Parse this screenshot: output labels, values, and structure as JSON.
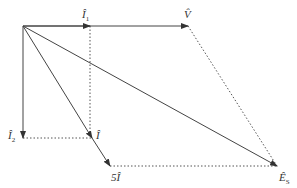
{
  "diagram": {
    "type": "phasor-diagram",
    "colors": {
      "line": "#444444",
      "dotted": "#555555",
      "text": "#333333",
      "background": "#ffffff"
    },
    "origin": {
      "x": 23,
      "y": 26
    },
    "vectors": [
      {
        "id": "I1",
        "label": "Î",
        "sub": "1",
        "from": [
          23,
          26
        ],
        "to": [
          90,
          26
        ],
        "style": "solid"
      },
      {
        "id": "V",
        "label": "V̂",
        "sub": "",
        "from": [
          23,
          26
        ],
        "to": [
          188,
          26
        ],
        "style": "solid"
      },
      {
        "id": "I2",
        "label": "Î",
        "sub": "2",
        "from": [
          23,
          26
        ],
        "to": [
          23,
          138
        ],
        "style": "solid"
      },
      {
        "id": "I",
        "label": "Î",
        "sub": "",
        "from": [
          23,
          26
        ],
        "to": [
          92,
          138
        ],
        "style": "solid"
      },
      {
        "id": "5I",
        "label": "5Î",
        "sub": "",
        "from": [
          92,
          138
        ],
        "to": [
          110,
          166
        ],
        "style": "solid"
      },
      {
        "id": "Es",
        "label": "Ê",
        "sub": "S",
        "from": [
          23,
          26
        ],
        "to": [
          277,
          166
        ],
        "style": "solid"
      }
    ],
    "guides": [
      {
        "from": [
          90,
          26
        ],
        "to": [
          90,
          138
        ]
      },
      {
        "from": [
          23,
          138
        ],
        "to": [
          92,
          138
        ]
      },
      {
        "from": [
          188,
          26
        ],
        "to": [
          277,
          166
        ]
      },
      {
        "from": [
          110,
          166
        ],
        "to": [
          277,
          166
        ]
      }
    ],
    "labels": {
      "i1": "Î",
      "i1_sub": "1",
      "v": "V̂",
      "i2": "Î",
      "i2_sub": "2",
      "i": "Î",
      "five_i": "5Î",
      "es": "Ê",
      "es_sub": "S"
    }
  }
}
